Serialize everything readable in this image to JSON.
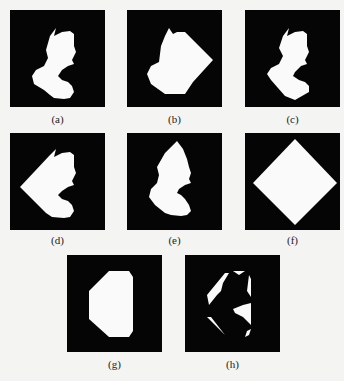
{
  "figure": {
    "background_color": "#f4f4f2",
    "panel_color": "#050505",
    "shape_color": "#fafafa",
    "panels": [
      {
        "id": "a",
        "label": "(a)",
        "description": "original silhouette shape"
      },
      {
        "id": "b",
        "label": "(b)",
        "description": "shape with convex region extended to right"
      },
      {
        "id": "c",
        "label": "(c)",
        "description": "shape with lower region cut diagonally"
      },
      {
        "id": "d",
        "label": "(d)",
        "description": "shape with left region extended to a point"
      },
      {
        "id": "e",
        "label": "(e)",
        "description": "shape with top extended to a point"
      },
      {
        "id": "f",
        "label": "(f)",
        "description": "diamond (square rotated 45 degrees)"
      },
      {
        "id": "g",
        "label": "(g)",
        "description": "octagon-like convex hull"
      },
      {
        "id": "h",
        "label": "(h)",
        "description": "difference between hull and silhouette"
      }
    ]
  }
}
